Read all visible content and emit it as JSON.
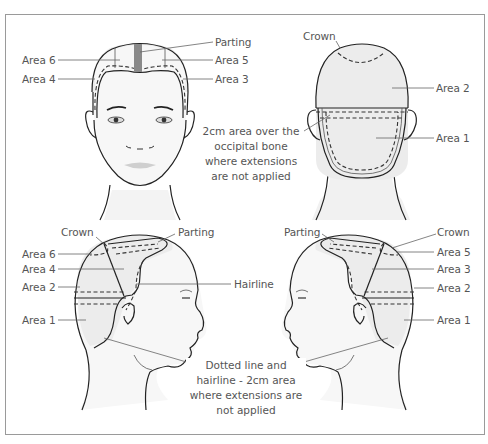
{
  "diagram": {
    "views": [
      {
        "name": "front",
        "labels": {
          "parting": "Parting",
          "area6": "Area 6",
          "area5": "Area 5",
          "area4": "Area 4",
          "area3": "Area 3"
        }
      },
      {
        "name": "back",
        "labels": {
          "crown": "Crown",
          "area2": "Area 2",
          "area1": "Area 1"
        },
        "note": [
          "2cm area over the",
          "occipital bone",
          "where extensions",
          "are not applied"
        ]
      },
      {
        "name": "left-profile",
        "labels": {
          "crown": "Crown",
          "parting": "Parting",
          "area6": "Area 6",
          "area4": "Area 4",
          "area2": "Area 2",
          "area1": "Area 1"
        }
      },
      {
        "name": "right-profile",
        "labels": {
          "parting": "Parting",
          "crown": "Crown",
          "area5": "Area 5",
          "area3": "Area 3",
          "area2": "Area 2",
          "area1": "Area 1"
        }
      }
    ],
    "shared_labels": {
      "hairline": "Hairline"
    },
    "bottom_note": [
      "Dotted line and",
      "hairline - 2cm area",
      "where extensions are",
      "not applied"
    ],
    "colors": {
      "outline": "#222222",
      "hair_fill": "#ececec",
      "skin_fill": "#f6f6f6",
      "parting_stripe": "#8a8a8a",
      "leader_line": "#666666",
      "text": "#555555",
      "frame": "#9a9a9a"
    }
  }
}
